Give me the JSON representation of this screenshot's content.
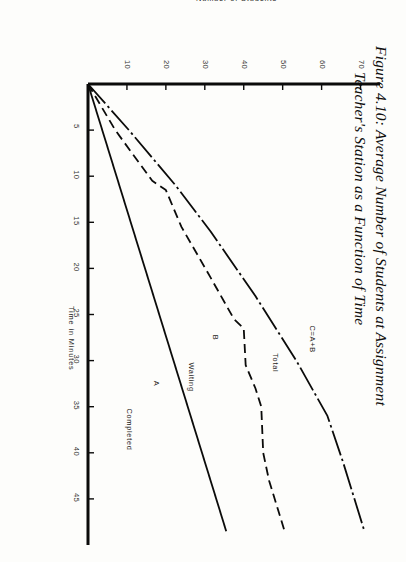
{
  "figure": {
    "title_line1": "Figure 4.10: Average Number of Students at Assignment",
    "title_line2": "Teacher's Station as a Function of Time"
  },
  "chart_data": {
    "type": "line",
    "title": "Figure 4.10: Average Number of Students at Assignment Teacher's Station as a Function of Time",
    "xlabel": "Time in Minutes",
    "ylabel": "Number of Students",
    "xlim": [
      0,
      50
    ],
    "ylim": [
      0,
      75
    ],
    "xticks": [
      5,
      10,
      15,
      20,
      25,
      30,
      35,
      40,
      45
    ],
    "yticks": [
      10,
      20,
      30,
      40,
      50,
      60,
      70
    ],
    "grid": false,
    "legend": "inline-labels",
    "series": [
      {
        "name": "Total",
        "label": "Total",
        "formula_label": "C=A+B",
        "style": "dash-dot",
        "points": [
          [
            0,
            0
          ],
          [
            5,
            10.5
          ],
          [
            11,
            22.5
          ],
          [
            16,
            31.5
          ],
          [
            23,
            43.0
          ],
          [
            30,
            53.5
          ],
          [
            36,
            61.5
          ],
          [
            41,
            65.5
          ],
          [
            48.5,
            71.0
          ]
        ]
      },
      {
        "name": "Waiting",
        "label": "Waiting",
        "formula_label": "B",
        "style": "dashed",
        "points": [
          [
            0,
            0
          ],
          [
            5,
            7.0
          ],
          [
            10.5,
            16.5
          ],
          [
            11.5,
            20.0
          ],
          [
            15.5,
            24.0
          ],
          [
            21,
            31.5
          ],
          [
            25.5,
            37.5
          ],
          [
            26.5,
            40.0
          ],
          [
            30.5,
            40.5
          ],
          [
            33,
            43.0
          ],
          [
            35,
            44.5
          ],
          [
            40,
            45.0
          ],
          [
            43,
            46.5
          ],
          [
            48.5,
            50.5
          ]
        ]
      },
      {
        "name": "Completed",
        "label": "Completed",
        "formula_label": "A",
        "style": "solid",
        "points": [
          [
            0,
            0
          ],
          [
            48.5,
            35.5
          ]
        ]
      }
    ]
  },
  "curve_labels": [
    {
      "text": "C=A+B",
      "series": "Total"
    },
    {
      "text": "Total",
      "series": "Total"
    },
    {
      "text": "B",
      "series": "Waiting"
    },
    {
      "text": "Waiting",
      "series": "Waiting"
    },
    {
      "text": "A",
      "series": "Completed"
    },
    {
      "text": "Completed",
      "series": "Completed"
    }
  ]
}
